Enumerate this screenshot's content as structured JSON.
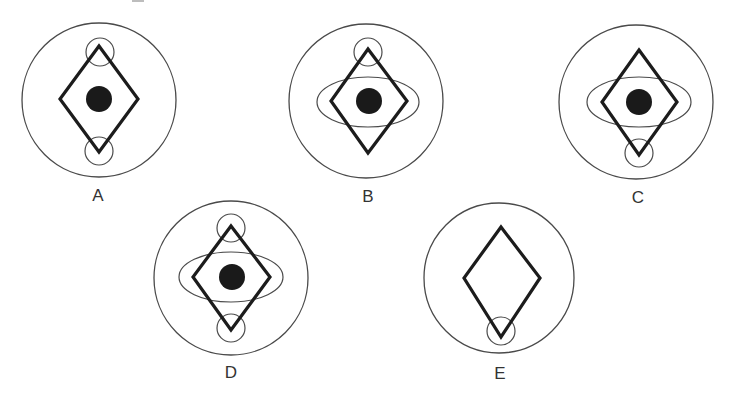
{
  "diagram": {
    "colors": {
      "outer_stroke": "#4a4a4a",
      "diamond_stroke": "#1c1c1c",
      "dot_fill": "#1a1a1a",
      "label_color": "#333333",
      "background": "#ffffff"
    },
    "options": [
      {
        "label": "A",
        "outer": {
          "cx": 99,
          "cy": 100,
          "r": 77
        },
        "diamond": {
          "top": [
            99,
            46
          ],
          "right": [
            138,
            99
          ],
          "bottom": [
            99,
            152
          ],
          "left": [
            60,
            99
          ]
        },
        "top_circle": {
          "cx": 100,
          "cy": 52,
          "r": 14
        },
        "bottom_circle": {
          "cx": 99,
          "cy": 151,
          "r": 14
        },
        "ellipse": null,
        "dot": {
          "cx": 99,
          "cy": 99,
          "r": 13
        },
        "label_pos": [
          98,
          195
        ]
      },
      {
        "label": "B",
        "outer": {
          "cx": 366,
          "cy": 101,
          "r": 77
        },
        "diamond": {
          "top": [
            368,
            49
          ],
          "right": [
            407,
            101
          ],
          "bottom": [
            368,
            153
          ],
          "left": [
            331,
            101
          ]
        },
        "top_circle": {
          "cx": 368,
          "cy": 52,
          "r": 14
        },
        "bottom_circle": null,
        "ellipse": {
          "cx": 368,
          "cy": 102,
          "rx": 51,
          "ry": 25
        },
        "dot": {
          "cx": 369,
          "cy": 101,
          "r": 13
        },
        "label_pos": [
          368,
          196
        ]
      },
      {
        "label": "C",
        "outer": {
          "cx": 636,
          "cy": 102,
          "r": 77
        },
        "diamond": {
          "top": [
            639,
            50
          ],
          "right": [
            677,
            102
          ],
          "bottom": [
            639,
            155
          ],
          "left": [
            602,
            102
          ]
        },
        "top_circle": null,
        "bottom_circle": {
          "cx": 639,
          "cy": 153,
          "r": 14
        },
        "ellipse": {
          "cx": 639,
          "cy": 102,
          "rx": 52,
          "ry": 25
        },
        "dot": {
          "cx": 639,
          "cy": 102,
          "r": 13
        },
        "label_pos": [
          638,
          197
        ]
      },
      {
        "label": "D",
        "outer": {
          "cx": 231,
          "cy": 278,
          "r": 77
        },
        "diamond": {
          "top": [
            231,
            226
          ],
          "right": [
            270,
            277
          ],
          "bottom": [
            231,
            330
          ],
          "left": [
            193,
            277
          ]
        },
        "top_circle": {
          "cx": 231,
          "cy": 228,
          "r": 14
        },
        "bottom_circle": {
          "cx": 231,
          "cy": 328,
          "r": 14
        },
        "ellipse": {
          "cx": 231,
          "cy": 277,
          "rx": 52,
          "ry": 25
        },
        "dot": {
          "cx": 232,
          "cy": 277,
          "r": 13
        },
        "label_pos": [
          231,
          372
        ]
      },
      {
        "label": "E",
        "outer": {
          "cx": 499,
          "cy": 278,
          "r": 75
        },
        "diamond": {
          "top": [
            501,
            227
          ],
          "right": [
            540,
            278
          ],
          "bottom": [
            501,
            337
          ],
          "left": [
            464,
            278
          ]
        },
        "top_circle": null,
        "bottom_circle": {
          "cx": 501,
          "cy": 331,
          "r": 14
        },
        "ellipse": null,
        "dot": null,
        "label_pos": [
          500,
          373
        ]
      }
    ]
  }
}
